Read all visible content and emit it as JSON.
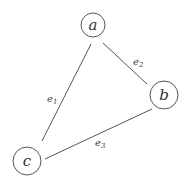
{
  "diagram": {
    "type": "graph",
    "nodes": [
      {
        "id": "a",
        "label": "a",
        "cx": 93,
        "cy": 25,
        "r": 12
      },
      {
        "id": "b",
        "label": "b",
        "cx": 164,
        "cy": 95,
        "r": 14
      },
      {
        "id": "c",
        "label": "c",
        "cx": 27,
        "cy": 161,
        "r": 14
      }
    ],
    "edges": [
      {
        "id": "e1",
        "base": "e",
        "sub": "1",
        "from": "a",
        "to": "c",
        "x1": 91,
        "y1": 44,
        "x2": 42,
        "y2": 141,
        "lx": 47,
        "ly": 102
      },
      {
        "id": "e2",
        "base": "e",
        "sub": "2",
        "from": "a",
        "to": "b",
        "x1": 103,
        "y1": 43,
        "x2": 147,
        "y2": 84,
        "lx": 133,
        "ly": 65
      },
      {
        "id": "e3",
        "base": "e",
        "sub": "3",
        "from": "b",
        "to": "c",
        "x1": 152,
        "y1": 109,
        "x2": 45,
        "y2": 159,
        "lx": 95,
        "ly": 146
      }
    ],
    "colors": {
      "stroke": "#555555",
      "text": "#333333",
      "background": "#ffffff"
    }
  }
}
